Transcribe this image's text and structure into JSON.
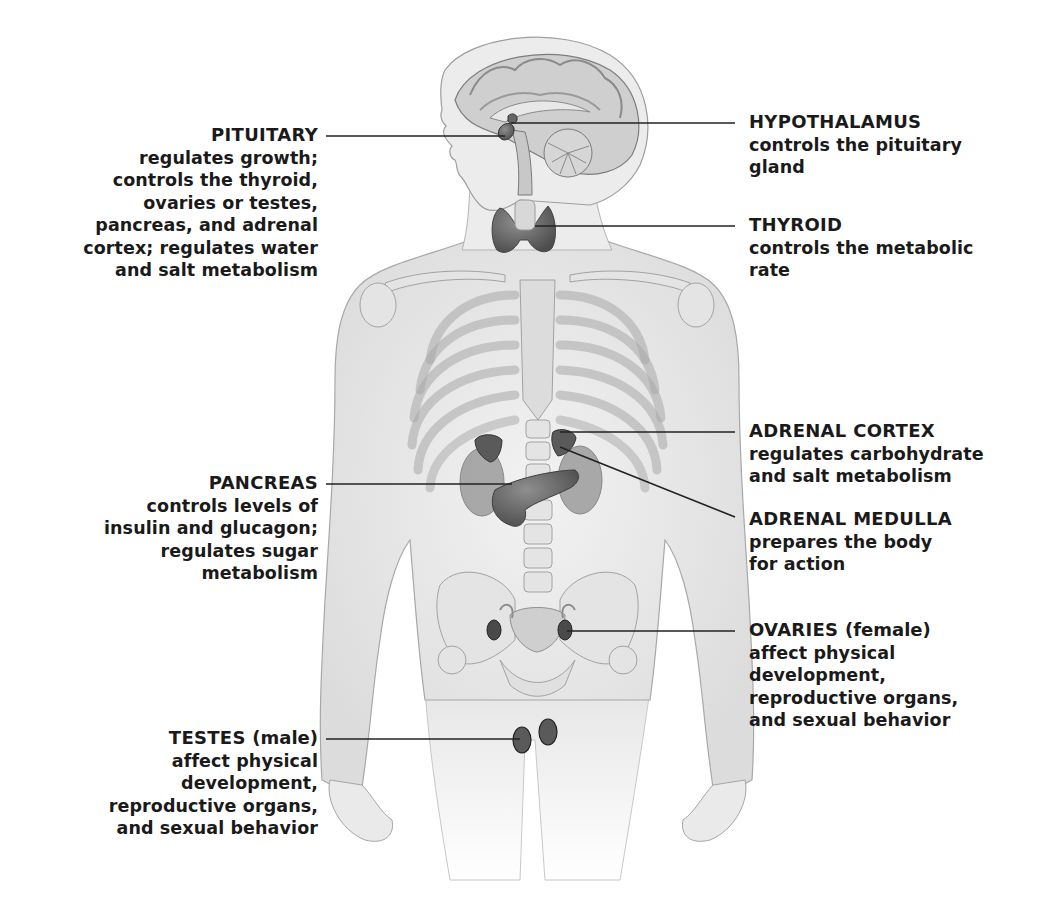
{
  "diagram": {
    "glands": [
      {
        "id": "pituitary",
        "title": "PITUITARY",
        "qualifier": "",
        "side": "left",
        "description_lines": [
          "regulates growth;",
          "controls the thyroid,",
          "ovaries or testes,",
          "pancreas, and adrenal",
          "cortex; regulates water",
          "and salt metabolism"
        ]
      },
      {
        "id": "hypothalamus",
        "title": "HYPOTHALAMUS",
        "qualifier": "",
        "side": "right",
        "description_lines": [
          "controls the pituitary",
          "gland"
        ]
      },
      {
        "id": "thyroid",
        "title": "THYROID",
        "qualifier": "",
        "side": "right",
        "description_lines": [
          "controls the metabolic",
          "rate"
        ]
      },
      {
        "id": "adrenal-cortex",
        "title": "ADRENAL CORTEX",
        "qualifier": "",
        "side": "right",
        "description_lines": [
          "regulates carbohydrate",
          "and salt metabolism"
        ]
      },
      {
        "id": "pancreas",
        "title": "PANCREAS",
        "qualifier": "",
        "side": "left",
        "description_lines": [
          "controls levels of",
          "insulin and glucagon;",
          "regulates sugar",
          "metabolism"
        ]
      },
      {
        "id": "adrenal-medulla",
        "title": "ADRENAL MEDULLA",
        "qualifier": "",
        "side": "right",
        "description_lines": [
          "prepares the body",
          "for action"
        ]
      },
      {
        "id": "ovaries",
        "title": "OVARIES",
        "qualifier": "(female)",
        "side": "right",
        "description_lines": [
          "affect physical",
          "development,",
          "reproductive organs,",
          "and sexual behavior"
        ]
      },
      {
        "id": "testes",
        "title": "TESTES",
        "qualifier": "(male)",
        "side": "left",
        "description_lines": [
          "affect physical",
          "development,",
          "reproductive organs,",
          "and sexual behavior"
        ]
      }
    ],
    "colors": {
      "text": "#1a1a1a",
      "leader_line": "#222222",
      "body_fill": "#eeeeee",
      "body_stroke": "#9a9a9a",
      "bone_fill": "#e2e2e2",
      "gland_fill": "#7a7a7a",
      "gland_dark": "#4a4a4a",
      "background": "#ffffff"
    }
  }
}
